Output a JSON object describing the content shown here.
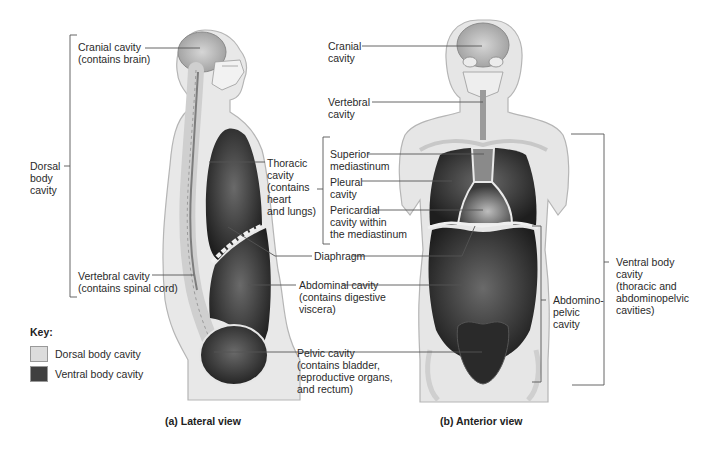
{
  "figure": {
    "colors": {
      "dorsal": "#dcdcdc",
      "ventral": "#3a3a3a",
      "body_fill": "#e6e6e6",
      "body_outline": "#b8b8b8",
      "leader": "#555555"
    },
    "lateral": {
      "caption": "(a)  Lateral view",
      "labels": {
        "cranial": "Cranial cavity\n(contains brain)",
        "dorsal": "Dorsal\nbody\ncavity",
        "thoracic": "Thoracic\ncavity\n(contains\nheart\nand lungs)",
        "vertebral": "Vertebral cavity\n(contains spinal cord)",
        "diaphragm": "Diaphragm",
        "abdominal": "Abdominal cavity\n(contains digestive\nviscera)",
        "pelvic": "Pelvic cavity\n(contains bladder,\nreproductive organs,\nand rectum)"
      }
    },
    "anterior": {
      "caption": "(b)  Anterior view",
      "labels": {
        "cranial": "Cranial\ncavity",
        "vertebral": "Vertebral\ncavity",
        "superior_mediastinum": "Superior\nmediastinum",
        "pleural": "Pleural\ncavity",
        "pericardial": "Pericardial\ncavity within\nthe mediastinum",
        "abdominopelvic": "Abdomino-\npelvic\ncavity",
        "ventral": "Ventral body\ncavity\n(thoracic and\nabdominopelvic\ncavities)"
      }
    },
    "key": {
      "title": "Key:",
      "items": [
        {
          "label": "Dorsal body cavity",
          "color": "#dcdcdc"
        },
        {
          "label": "Ventral body cavity",
          "color": "#3f3f3f"
        }
      ]
    }
  }
}
